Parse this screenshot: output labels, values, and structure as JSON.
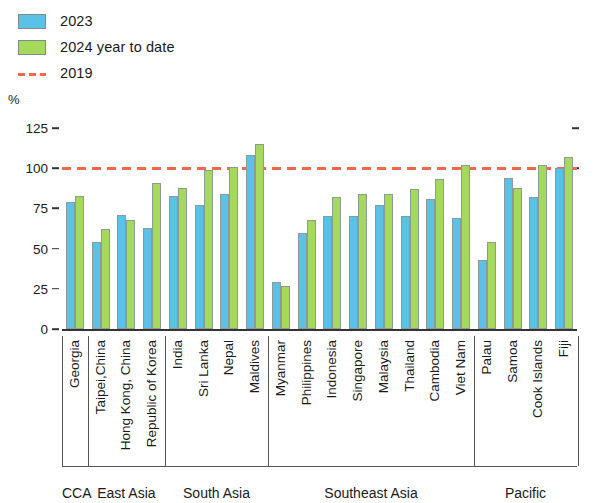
{
  "legend": {
    "items": [
      {
        "label": "2023",
        "type": "bar",
        "color": "#5bc2e7"
      },
      {
        "label": "2024 year to date",
        "type": "bar",
        "color": "#a5d95b"
      },
      {
        "label": "2019",
        "type": "dashed-line",
        "color": "#f4674a"
      }
    ]
  },
  "axis": {
    "unit_label": "%",
    "yticks": [
      "125",
      "100",
      "75",
      "50",
      "25",
      "0"
    ]
  },
  "regions": [
    {
      "name": "CCA",
      "count": 1
    },
    {
      "name": "East Asia",
      "count": 3
    },
    {
      "name": "South Asia",
      "count": 4
    },
    {
      "name": "Southeast Asia",
      "count": 8
    },
    {
      "name": "Pacific",
      "count": 4
    }
  ],
  "chart_data": {
    "type": "bar",
    "title": "",
    "xlabel": "",
    "ylabel": "%",
    "ylim": [
      0,
      125
    ],
    "yticks": [
      0,
      25,
      50,
      75,
      100,
      125
    ],
    "grid": false,
    "legend_position": "top-left",
    "reference_line": {
      "label": "2019",
      "value": 100,
      "style": "dashed",
      "color": "#f4674a"
    },
    "categories": [
      "Georgia",
      "Taipei,China",
      "Hong Kong, China",
      "Republic of Korea",
      "India",
      "Sri Lanka",
      "Nepal",
      "Maldives",
      "Myanmar",
      "Philippines",
      "Indonesia",
      "Singapore",
      "Malaysia",
      "Thailand",
      "Cambodia",
      "Viet Nam",
      "Palau",
      "Samoa",
      "Cook Islands",
      "Fiji"
    ],
    "category_regions": [
      "CCA",
      "East Asia",
      "East Asia",
      "East Asia",
      "South Asia",
      "South Asia",
      "South Asia",
      "South Asia",
      "Southeast Asia",
      "Southeast Asia",
      "Southeast Asia",
      "Southeast Asia",
      "Southeast Asia",
      "Southeast Asia",
      "Southeast Asia",
      "Southeast Asia",
      "Pacific",
      "Pacific",
      "Pacific",
      "Pacific"
    ],
    "series": [
      {
        "name": "2023",
        "color": "#5bc2e7",
        "values": [
          79,
          54,
          71,
          63,
          83,
          77,
          84,
          108,
          29,
          60,
          70,
          70,
          77,
          70,
          81,
          69,
          43,
          94,
          82,
          100
        ]
      },
      {
        "name": "2024 year to date",
        "color": "#a5d95b",
        "values": [
          83,
          62,
          68,
          91,
          88,
          99,
          101,
          115,
          27,
          68,
          82,
          84,
          84,
          87,
          93,
          102,
          54,
          88,
          102,
          107
        ]
      }
    ]
  }
}
